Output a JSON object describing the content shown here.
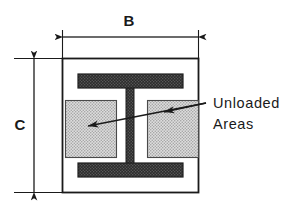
{
  "figure": {
    "type": "engineering-cross-section-diagram",
    "background_color": "#ffffff",
    "line_color": "#1a1a1a"
  },
  "dimensions": {
    "width_label": "B",
    "height_label": "C"
  },
  "callout": {
    "line1": "Unloaded",
    "line2": "Areas"
  },
  "geometry": {
    "outer_box": {
      "x": 62,
      "y": 58,
      "width": 137,
      "height": 135
    },
    "top_flange": {
      "x": 78,
      "y": 74,
      "width": 105,
      "height": 14
    },
    "bottom_flange": {
      "x": 78,
      "y": 163,
      "width": 105,
      "height": 14
    },
    "web": {
      "x": 126,
      "y": 88,
      "width": 8,
      "height": 75
    },
    "unloaded_left": {
      "x": 65,
      "y": 100,
      "width": 52,
      "height": 58
    },
    "unloaded_right": {
      "x": 147,
      "y": 100,
      "width": 52,
      "height": 58
    }
  },
  "colors": {
    "flange_fill": "#2b2b2b",
    "unloaded_fill": "#c9c9c9",
    "outline": "#1a1a1a",
    "background": "#ffffff"
  }
}
